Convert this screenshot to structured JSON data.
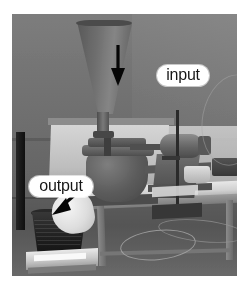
{
  "figure": {
    "kind": "photograph",
    "color_mode": "grayscale",
    "width_px": 247,
    "height_px": 289
  },
  "annotations": [
    {
      "id": "input",
      "label": "input",
      "arrow": "arrow-down",
      "points_to": "feed-hopper",
      "pill_color": "#fbfbfb",
      "text_color": "#1c1c1c",
      "arrow_color": "#0d0d0d"
    },
    {
      "id": "output",
      "label": "output",
      "arrow": "arrow-down-left",
      "points_to": "collection-bucket",
      "pill_color": "#fbfbfb",
      "text_color": "#1c1c1c",
      "arrow_color": "#0d0d0d"
    }
  ],
  "scene": {
    "photo_background": "#6e6e6e",
    "page_background": "#ffffff",
    "objects": [
      "feed-hopper",
      "mill-body",
      "electric-motor",
      "support-stand-rod",
      "work-table",
      "collection-bucket",
      "white-bag",
      "bench-scale",
      "wall-panel",
      "power-cables"
    ]
  }
}
